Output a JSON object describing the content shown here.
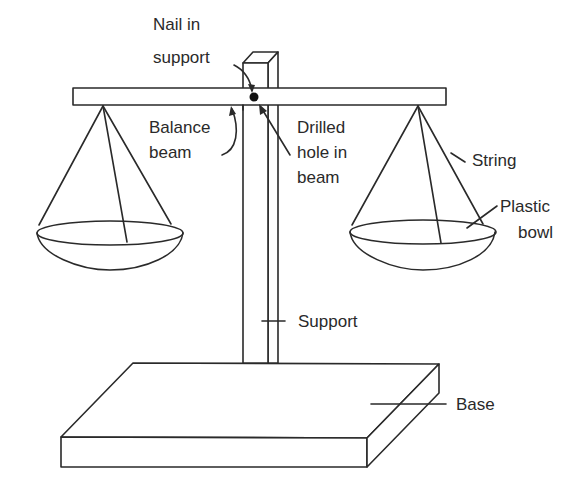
{
  "diagram": {
    "labels": {
      "nail_line1": "Nail in",
      "nail_line2": "support",
      "beam_line1": "Balance",
      "beam_line2": "beam",
      "hole_line1": "Drilled",
      "hole_line2": "hole in",
      "hole_line3": "beam",
      "string": "String",
      "bowl_line1": "Plastic",
      "bowl_line2": "bowl",
      "support": "Support",
      "base": "Base"
    },
    "colors": {
      "stroke": "#2a2a2a",
      "background": "#ffffff"
    }
  }
}
